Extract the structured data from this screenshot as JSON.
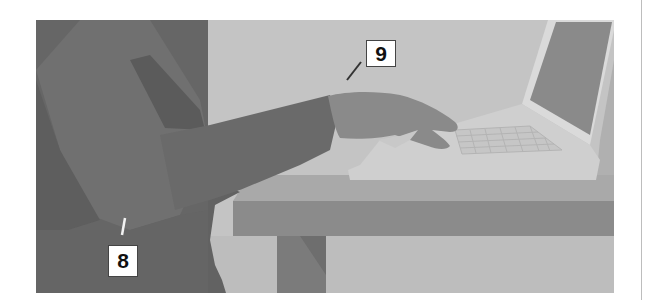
{
  "figure": {
    "colors": {
      "wall": "#c4c4c4",
      "dark_panel": "#666666",
      "body_mid": "#707070",
      "body_shadow": "#5a5a5a",
      "arm": "#6a6a6a",
      "hand": "#8a8a8a",
      "table_top": "#a8a8a8",
      "table_apron": "#8c8c8c",
      "table_leg": "#7a7a7a",
      "laptop_base": "#d0d0d0",
      "laptop_screen": "#8a8a8a",
      "laptop_bezel": "#dcdcdc",
      "floor": "#bcbcbc",
      "divider": "#bdbdbd"
    }
  },
  "callouts": [
    {
      "id": "8",
      "label": "8"
    },
    {
      "id": "9",
      "label": "9"
    }
  ]
}
